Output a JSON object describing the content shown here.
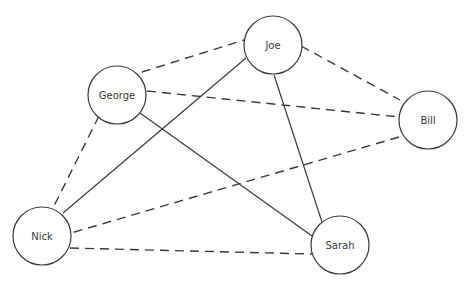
{
  "diagram": {
    "type": "social-network-graph",
    "nodes": [
      {
        "id": "george",
        "label": "George",
        "cx": 117,
        "cy": 95,
        "r": 29
      },
      {
        "id": "joe",
        "label": "Joe",
        "cx": 273,
        "cy": 45,
        "r": 29
      },
      {
        "id": "bill",
        "label": "Bill",
        "cx": 428,
        "cy": 120,
        "r": 29
      },
      {
        "id": "nick",
        "label": "Nick",
        "cx": 42,
        "cy": 236,
        "r": 29
      },
      {
        "id": "sarah",
        "label": "Sarah",
        "cx": 340,
        "cy": 245,
        "r": 29
      }
    ],
    "edges": [
      {
        "from": "george",
        "to": "joe",
        "style": "dashed",
        "x1": 142,
        "y1": 72,
        "x2": 244,
        "y2": 40
      },
      {
        "from": "george",
        "to": "bill",
        "style": "dashed",
        "x1": 147,
        "y1": 91,
        "x2": 399,
        "y2": 117
      },
      {
        "from": "george",
        "to": "nick",
        "style": "dashed",
        "x1": 99,
        "y1": 116,
        "x2": 53,
        "y2": 208
      },
      {
        "from": "george",
        "to": "sarah",
        "style": "solid",
        "x1": 140,
        "y1": 113,
        "x2": 312,
        "y2": 236
      },
      {
        "from": "joe",
        "to": "bill",
        "style": "dashed",
        "x1": 301,
        "y1": 46,
        "x2": 400,
        "y2": 100
      },
      {
        "from": "joe",
        "to": "nick",
        "style": "solid",
        "x1": 246,
        "y1": 58,
        "x2": 63,
        "y2": 213
      },
      {
        "from": "joe",
        "to": "sarah",
        "style": "solid",
        "x1": 274,
        "y1": 75,
        "x2": 322,
        "y2": 222
      },
      {
        "from": "bill",
        "to": "nick",
        "style": "dashed",
        "x1": 399,
        "y1": 137,
        "x2": 71,
        "y2": 233
      },
      {
        "from": "nick",
        "to": "sarah",
        "style": "dashed",
        "x1": 70,
        "y1": 248,
        "x2": 312,
        "y2": 254
      }
    ],
    "colors": {
      "stroke": "#3a3a3a",
      "text": "#3a3a3a",
      "background": "#ffffff"
    }
  }
}
